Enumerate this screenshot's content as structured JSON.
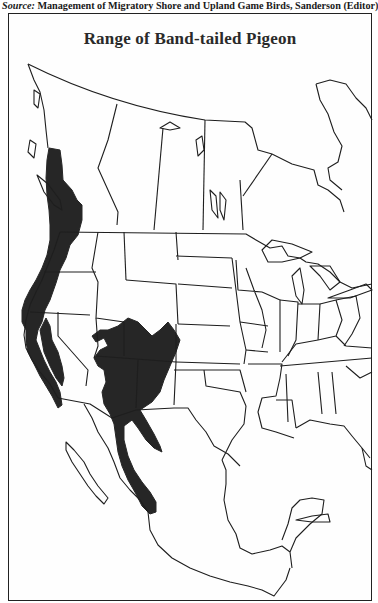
{
  "source": {
    "label": "Source:",
    "text": "Management of Migratory Shore and Upland Game Birds, Sanderson (Editor)"
  },
  "map": {
    "title": "Range of Band-tailed Pigeon",
    "region": "North America (Canada, United States, Mexico)",
    "range_color": "#262626",
    "border_color": "#1e1e1e",
    "range_areas": [
      "Pacific coast from British Columbia through Washington, Oregon and California",
      "Interior Southwest: Utah, Colorado, Arizona, New Mexico",
      "Sierra Madre Occidental, Mexico"
    ]
  }
}
